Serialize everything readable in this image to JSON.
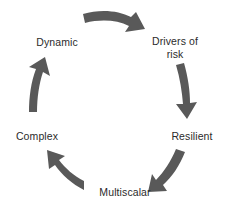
{
  "diagram": {
    "type": "cyclical-process",
    "direction": "clockwise",
    "background_color": "#ffffff",
    "arrow_color": "#595959",
    "text_color": "#2b2b2b",
    "nodes": [
      {
        "id": "drivers-of-risk",
        "label": "Drivers of\nrisk",
        "position": "top-right",
        "order": 1
      },
      {
        "id": "resilient",
        "label": "Resilient",
        "position": "right",
        "order": 2
      },
      {
        "id": "multiscalar",
        "label": "Multiscalar",
        "position": "bottom",
        "order": 3
      },
      {
        "id": "complex",
        "label": "Complex",
        "position": "left",
        "order": 4
      },
      {
        "id": "dynamic",
        "label": "Dynamic",
        "position": "top-left",
        "order": 5
      }
    ],
    "arrows": [
      {
        "id": "arrow-dynamic-to-drivers",
        "from": "dynamic",
        "to": "drivers-of-risk",
        "position": "top",
        "points": "right-down"
      },
      {
        "id": "arrow-drivers-to-resilient",
        "from": "drivers-of-risk",
        "to": "resilient",
        "position": "right",
        "points": "down"
      },
      {
        "id": "arrow-resilient-to-multiscalar",
        "from": "resilient",
        "to": "multiscalar",
        "position": "bottom-right",
        "points": "left-down"
      },
      {
        "id": "arrow-multiscalar-to-complex",
        "from": "multiscalar",
        "to": "complex",
        "position": "bottom-left",
        "points": "up-left"
      },
      {
        "id": "arrow-complex-to-dynamic",
        "from": "complex",
        "to": "dynamic",
        "position": "left",
        "points": "up"
      }
    ]
  }
}
